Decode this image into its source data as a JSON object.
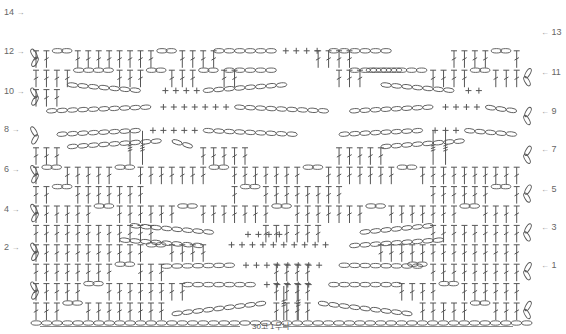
{
  "legend_note": "30코 1무늬",
  "rows_left": [
    {
      "label": "14",
      "y": 13
    },
    {
      "label": "12",
      "y": 52
    },
    {
      "label": "10",
      "y": 92
    },
    {
      "label": "8",
      "y": 130
    },
    {
      "label": "6",
      "y": 170
    },
    {
      "label": "4",
      "y": 210
    },
    {
      "label": "2",
      "y": 248
    }
  ],
  "rows_right": [
    {
      "label": "13",
      "y": 33
    },
    {
      "label": "11",
      "y": 73
    },
    {
      "label": "9",
      "y": 112
    },
    {
      "label": "7",
      "y": 150
    },
    {
      "label": "5",
      "y": 190
    },
    {
      "label": "3",
      "y": 228
    },
    {
      "label": "1",
      "y": 266
    }
  ],
  "arrows": {
    "left": "→",
    "right": "←"
  },
  "stitch_symbols": {
    "chain": "oval",
    "single_crochet": "+",
    "double_crochet": "T-with-slash",
    "crossed_long": "long-stem-triple-slash"
  },
  "colors": {
    "ink": "#555555",
    "label": "#666666",
    "background": "#ffffff"
  },
  "grid": {
    "x0": 36,
    "dx": 10.45,
    "cols": 47,
    "row_top": 9,
    "dy": 19.4,
    "rows": 15,
    "foundation_y": 323
  }
}
